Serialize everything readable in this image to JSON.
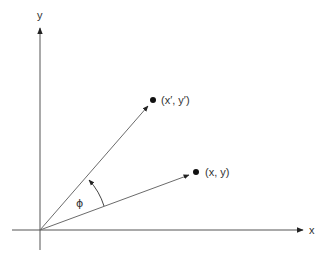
{
  "diagram": {
    "type": "vector-rotation",
    "colors": {
      "line": "#6b6b6b",
      "axis": "#555555",
      "point": "#111111",
      "text": "#333333",
      "background": "#ffffff"
    },
    "axes": {
      "origin": [
        40,
        230
      ],
      "x_axis": {
        "label": "x",
        "from": [
          12,
          230
        ],
        "to": [
          304,
          230
        ]
      },
      "y_axis": {
        "label": "y",
        "from": [
          40,
          250
        ],
        "to": [
          40,
          27
        ]
      }
    },
    "vectors": [
      {
        "name": "original",
        "label": "(x, y)",
        "from": [
          40,
          230
        ],
        "to": [
          196,
          172
        ]
      },
      {
        "name": "rotated",
        "label": "(x′, y′)",
        "from": [
          40,
          230
        ],
        "to": [
          153,
          100
        ]
      }
    ],
    "angle": {
      "label": "ϕ",
      "description": "rotation angle from (x, y) to (x′, y′)"
    }
  }
}
